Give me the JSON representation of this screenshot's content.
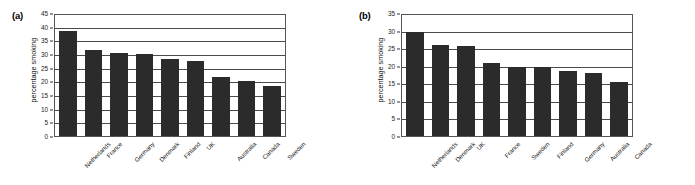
{
  "figure": {
    "panels": [
      {
        "label": "(a)",
        "name": "panel-a"
      },
      {
        "label": "(b)",
        "name": "panel-b"
      }
    ]
  },
  "chart_data": [
    {
      "type": "bar",
      "panel": "(a)",
      "title": "",
      "xlabel": "",
      "ylabel": "percentage smoking",
      "ylim": [
        0,
        45
      ],
      "ytick_step": 5,
      "yticks": [
        0,
        5,
        10,
        15,
        20,
        25,
        30,
        35,
        40,
        45
      ],
      "grid": true,
      "legend": "none",
      "bar_color": "#2b2b2b",
      "categories": [
        "Netherlands",
        "France",
        "Germany",
        "Denmark",
        "Finland",
        "UK",
        "Australia",
        "Canada",
        "Sweden"
      ],
      "values": [
        39,
        32,
        31,
        30.5,
        28.5,
        28,
        21.8,
        20.3,
        18.6
      ]
    },
    {
      "type": "bar",
      "panel": "(b)",
      "title": "",
      "xlabel": "",
      "ylabel": "percentage smoking",
      "ylim": [
        0,
        35
      ],
      "ytick_step": 5,
      "yticks": [
        0,
        5,
        10,
        15,
        20,
        25,
        30,
        35
      ],
      "grid": true,
      "legend": "none",
      "bar_color": "#2b2b2b",
      "categories": [
        "Netherlands",
        "Denmark",
        "UK",
        "France",
        "Sweden",
        "Finland",
        "Germany",
        "Australia",
        "Canada"
      ],
      "values": [
        30,
        26.2,
        26,
        21,
        20,
        20,
        18.7,
        18.1,
        15.6
      ]
    }
  ]
}
